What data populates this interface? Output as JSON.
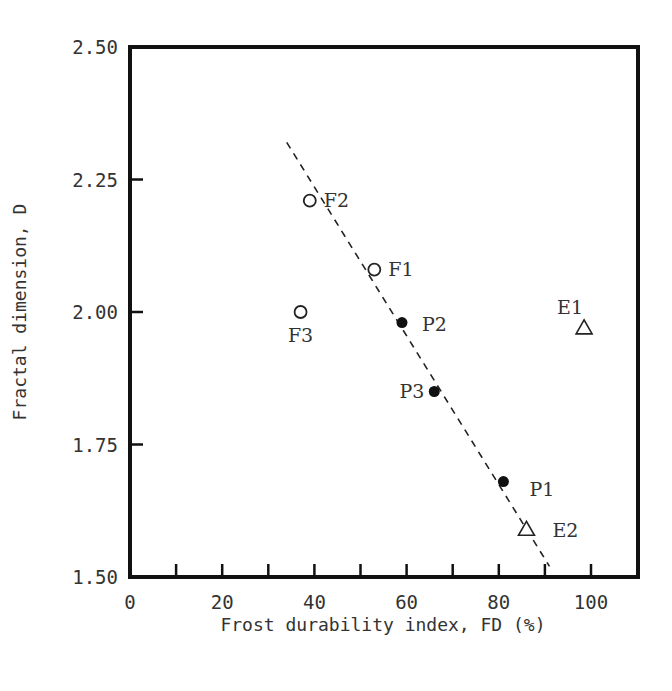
{
  "chart_data": {
    "type": "scatter",
    "title": "",
    "xlabel": "Frost durability index, FD (%)",
    "ylabel": "Fractal dimension, D",
    "xlim": [
      0,
      110
    ],
    "ylim": [
      1.5,
      2.5
    ],
    "x_ticks": [
      0,
      10,
      20,
      30,
      40,
      50,
      60,
      70,
      80,
      90,
      100
    ],
    "x_tick_labels": [
      "0",
      "20",
      "40",
      "60",
      "80",
      "100"
    ],
    "y_ticks": [
      1.5,
      1.75,
      2.0,
      2.25,
      2.5
    ],
    "y_tick_labels": [
      "1.50",
      "1.75",
      "2.00",
      "2.25",
      "2.50"
    ],
    "grid": false,
    "legend": null,
    "series": [
      {
        "name": "F",
        "marker": "open-circle",
        "points": [
          {
            "label": "F1",
            "x": 53,
            "y": 2.08
          },
          {
            "label": "F2",
            "x": 39,
            "y": 2.21
          },
          {
            "label": "F3",
            "x": 37,
            "y": 2.0
          }
        ]
      },
      {
        "name": "P",
        "marker": "filled-circle",
        "points": [
          {
            "label": "P1",
            "x": 81,
            "y": 1.68
          },
          {
            "label": "P2",
            "x": 59,
            "y": 1.98
          },
          {
            "label": "P3",
            "x": 66,
            "y": 1.85
          }
        ]
      },
      {
        "name": "E",
        "marker": "open-triangle",
        "points": [
          {
            "label": "E1",
            "x": 98.5,
            "y": 1.97
          },
          {
            "label": "E2",
            "x": 86,
            "y": 1.59
          }
        ]
      }
    ],
    "trend_line": {
      "style": "dashed",
      "from": {
        "x": 34,
        "y": 2.32
      },
      "to": {
        "x": 91,
        "y": 1.52
      }
    }
  }
}
